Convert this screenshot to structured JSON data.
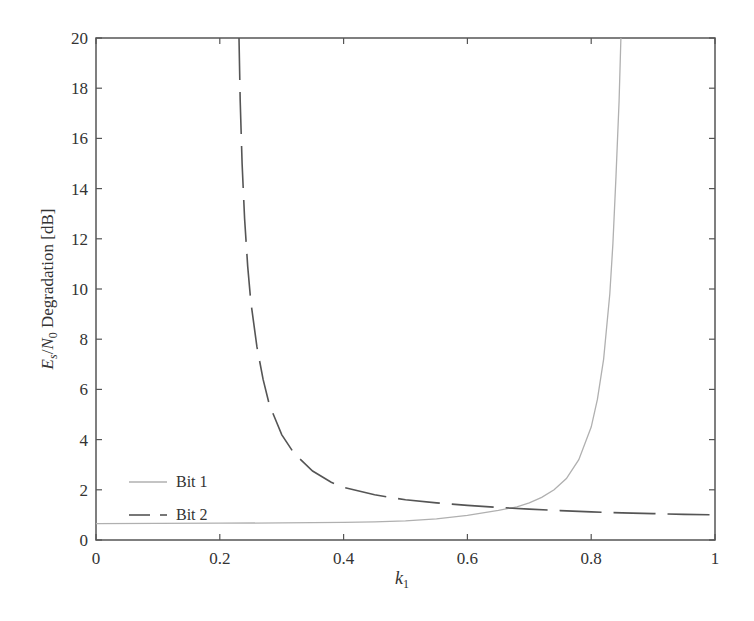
{
  "chart_data": {
    "type": "line",
    "title": "",
    "xlabel": "k1",
    "xlabel_main": "k",
    "xlabel_sub": "1",
    "ylabel": "Es/N0 Degradation [dB]",
    "ylabel_parts": {
      "E": "E",
      "s": "s",
      "slash": "/",
      "N": "N",
      "zero": "0",
      "rest": " Degradation [dB]"
    },
    "xlim": [
      0,
      1
    ],
    "ylim": [
      0,
      20
    ],
    "xticks": [
      0,
      0.2,
      0.4,
      0.6,
      0.8,
      1
    ],
    "xtick_labels": [
      "0",
      "0.2",
      "0.4",
      "0.6",
      "0.8",
      "1"
    ],
    "yticks": [
      0,
      2,
      4,
      6,
      8,
      10,
      12,
      14,
      16,
      18,
      20
    ],
    "ytick_labels": [
      "0",
      "2",
      "4",
      "6",
      "8",
      "10",
      "12",
      "14",
      "16",
      "18",
      "20"
    ],
    "grid": false,
    "legend_position": "lower left",
    "series": [
      {
        "name": "Bit 1",
        "style": "solid",
        "color": "#b0b0b0",
        "x": [
          0,
          0.1,
          0.2,
          0.3,
          0.4,
          0.45,
          0.5,
          0.55,
          0.6,
          0.65,
          0.68,
          0.7,
          0.72,
          0.74,
          0.76,
          0.78,
          0.8,
          0.81,
          0.82,
          0.83,
          0.835,
          0.84,
          0.845,
          0.848
        ],
        "y": [
          0.65,
          0.66,
          0.67,
          0.68,
          0.7,
          0.72,
          0.76,
          0.84,
          0.98,
          1.18,
          1.32,
          1.48,
          1.7,
          2.0,
          2.45,
          3.2,
          4.5,
          5.6,
          7.2,
          9.8,
          11.8,
          14.5,
          17.5,
          20
        ]
      },
      {
        "name": "Bit 2",
        "style": "dashed",
        "color": "#555555",
        "x": [
          0.231,
          0.233,
          0.236,
          0.24,
          0.245,
          0.25,
          0.26,
          0.27,
          0.28,
          0.3,
          0.32,
          0.35,
          0.38,
          0.4,
          0.45,
          0.5,
          0.55,
          0.6,
          0.65,
          0.7,
          0.75,
          0.8,
          0.85,
          0.9,
          0.95,
          1.0
        ],
        "y": [
          20,
          17.5,
          15.0,
          12.8,
          10.9,
          9.5,
          7.7,
          6.4,
          5.4,
          4.2,
          3.45,
          2.75,
          2.3,
          2.1,
          1.8,
          1.6,
          1.48,
          1.38,
          1.3,
          1.23,
          1.17,
          1.12,
          1.08,
          1.05,
          1.02,
          1.0
        ]
      }
    ]
  },
  "legend": {
    "items": [
      {
        "label": "Bit 1"
      },
      {
        "label": "Bit 2"
      }
    ]
  }
}
